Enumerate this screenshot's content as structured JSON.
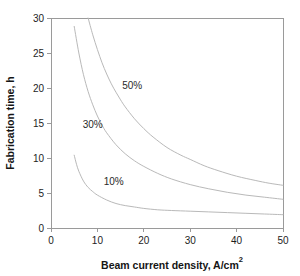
{
  "chart_data": {
    "type": "line",
    "title": "",
    "xlabel": "Beam current density, A/cm2",
    "xlabel_base": "Beam current density, A/cm",
    "xlabel_sup": "2",
    "ylabel": "Fabrication time, h",
    "xlim": [
      0,
      50
    ],
    "ylim": [
      0,
      30
    ],
    "xticks": [
      0,
      10,
      20,
      30,
      40,
      50
    ],
    "yticks": [
      0,
      5,
      10,
      15,
      20,
      25,
      30
    ],
    "xtick_labels": [
      "0",
      "10",
      "20",
      "30",
      "40",
      "50"
    ],
    "ytick_labels": [
      "0",
      "5",
      "10",
      "15",
      "20",
      "25",
      "30"
    ],
    "grid": false,
    "legend_position": "inline-annotations",
    "series": [
      {
        "name": "50%",
        "label": "50%",
        "label_x": 17.5,
        "label_y": 20.4,
        "color": "#b9b9b9",
        "x": [
          8.0,
          9.0,
          10.0,
          11.0,
          12.0,
          13.0,
          14.0,
          15.0,
          16.0,
          18.0,
          20.0,
          22.0,
          25.0,
          28.0,
          30.0,
          33.0,
          36.0,
          40.0,
          44.0,
          47.0,
          50.0
        ],
        "y": [
          30.0,
          27.6,
          25.5,
          23.6,
          22.0,
          20.6,
          19.4,
          18.3,
          17.3,
          15.6,
          14.2,
          13.0,
          11.5,
          10.4,
          9.8,
          8.9,
          8.2,
          7.4,
          6.8,
          6.4,
          6.1
        ]
      },
      {
        "name": "30%",
        "label": "30%",
        "label_x": 9.0,
        "label_y": 14.8,
        "color": "#b9b9b9",
        "x": [
          5.0,
          6.0,
          7.0,
          8.0,
          9.0,
          10.0,
          11.0,
          12.0,
          14.0,
          16.0,
          18.0,
          20.0,
          23.0,
          26.0,
          30.0,
          34.0,
          38.0,
          42.0,
          46.0,
          50.0
        ],
        "y": [
          28.8,
          25.0,
          21.9,
          19.5,
          17.6,
          16.0,
          14.7,
          13.6,
          11.9,
          10.6,
          9.6,
          8.8,
          7.8,
          7.0,
          6.2,
          5.6,
          5.1,
          4.7,
          4.4,
          4.1
        ]
      },
      {
        "name": "10%",
        "label": "10%",
        "label_x": 13.5,
        "label_y": 6.6,
        "color": "#b9b9b9",
        "x": [
          5.0,
          5.5,
          6.0,
          7.0,
          8.0,
          9.0,
          10.0,
          12.0,
          14.0,
          16.0,
          18.0,
          20.0,
          23.0,
          26.0,
          30.0,
          34.0,
          38.0,
          42.0,
          46.0,
          50.0
        ],
        "y": [
          10.4,
          9.1,
          8.1,
          6.7,
          5.8,
          5.2,
          4.7,
          4.0,
          3.5,
          3.2,
          3.0,
          2.8,
          2.6,
          2.5,
          2.4,
          2.3,
          2.2,
          2.1,
          2.0,
          1.9
        ]
      }
    ]
  }
}
